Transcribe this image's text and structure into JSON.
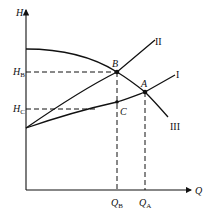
{
  "figure": {
    "top_caption_fragment": "",
    "axes": {
      "y_label": "H",
      "x_label": "Q"
    },
    "points": [
      {
        "name": "A",
        "label": "A"
      },
      {
        "name": "B",
        "label": "B"
      },
      {
        "name": "C",
        "label": "C"
      }
    ],
    "y_ticks": [
      {
        "main": "H",
        "sub": "B"
      },
      {
        "main": "H",
        "sub": "C"
      }
    ],
    "x_ticks": [
      {
        "main": "Q",
        "sub": "B"
      },
      {
        "main": "Q",
        "sub": "A"
      }
    ],
    "curves": [
      {
        "name": "pipe-curve-1",
        "label": "I"
      },
      {
        "name": "pipe-curve-2",
        "label": "II"
      },
      {
        "name": "pump-curve-3",
        "label": "III"
      }
    ]
  }
}
